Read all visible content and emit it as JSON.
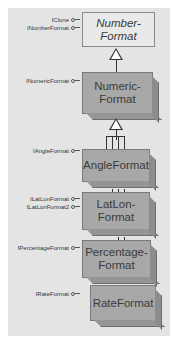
{
  "diagram": {
    "type": "class-hierarchy",
    "colors": {
      "panel_background": "#e4e4e4",
      "abstract_fill": "#e9e9e9",
      "concrete_fill": "#a8a8a8",
      "line": "#333333"
    },
    "classes": [
      {
        "name": "NumberFormat",
        "label_line1": "Number-",
        "label_line2": "Format",
        "kind": "abstract",
        "interfaces": [
          "IClone",
          "INumberFormat"
        ]
      },
      {
        "name": "NumericFormat",
        "label_line1": "Numeric-",
        "label_line2": "Format",
        "kind": "concrete",
        "interfaces": [
          "INumericFormat"
        ]
      },
      {
        "name": "AngleFormat",
        "label_line1": "AngleFormat",
        "label_line2": "",
        "kind": "concrete",
        "interfaces": [
          "IAngleFormat"
        ]
      },
      {
        "name": "LatLonFormat",
        "label_line1": "LatLon-",
        "label_line2": "Format",
        "kind": "concrete",
        "interfaces": [
          "ILatLonFormat",
          "ILatLonFormat2"
        ]
      },
      {
        "name": "PercentageFormat",
        "label_line1": "Percentage-",
        "label_line2": "Format",
        "kind": "concrete",
        "interfaces": [
          "IPercentageFormat"
        ]
      },
      {
        "name": "RateFormat",
        "label_line1": "RateFormat",
        "label_line2": "",
        "kind": "concrete",
        "interfaces": [
          "IRateFormat"
        ]
      }
    ],
    "relationships": [
      {
        "from": "NumericFormat",
        "to": "NumberFormat",
        "type": "inheritance"
      },
      {
        "from": "AngleFormat",
        "to": "NumericFormat",
        "type": "inheritance"
      },
      {
        "from": "LatLonFormat",
        "to": "NumericFormat",
        "type": "inheritance"
      },
      {
        "from": "PercentageFormat",
        "to": "NumericFormat",
        "type": "inheritance"
      },
      {
        "from": "RateFormat",
        "to": "NumericFormat",
        "type": "inheritance"
      }
    ]
  }
}
